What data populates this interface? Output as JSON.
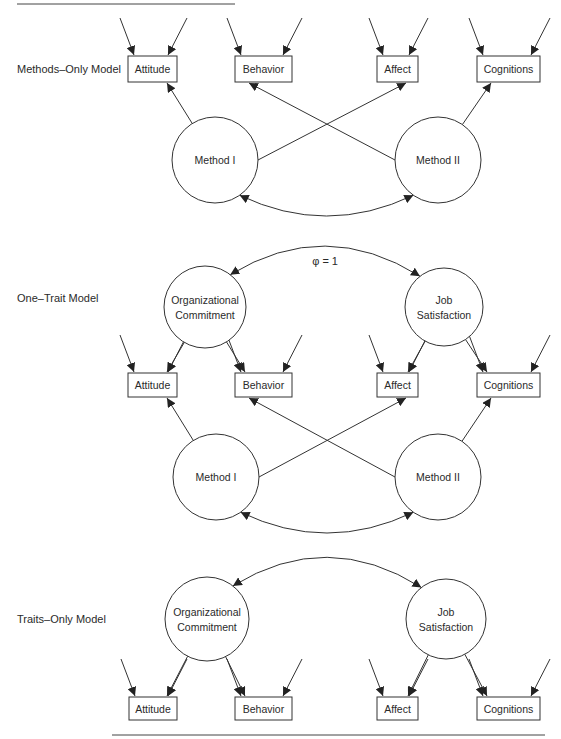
{
  "rules": {
    "top": {
      "x1": 17,
      "x2": 235,
      "y": 4
    },
    "bottom": {
      "x1": 112,
      "x2": 545,
      "y": 735
    }
  },
  "panels": [
    {
      "id": "methods-only",
      "label": "Methods–Only Model",
      "label_pos": [
        17,
        73
      ],
      "boxes": [
        {
          "id": "attitude",
          "label": "Attitude",
          "x": 128,
          "y": 56,
          "w": 49,
          "h": 26
        },
        {
          "id": "behavior",
          "label": "Behavior",
          "x": 235,
          "y": 56,
          "w": 57,
          "h": 26
        },
        {
          "id": "affect",
          "label": "Affect",
          "x": 377,
          "y": 56,
          "w": 41,
          "h": 26
        },
        {
          "id": "cognitions",
          "label": "Cognitions",
          "x": 477,
          "y": 56,
          "w": 63,
          "h": 26
        }
      ],
      "latents": [
        {
          "id": "method-1",
          "lines": [
            "Method I"
          ],
          "cx": 215,
          "cy": 160,
          "r": 43
        },
        {
          "id": "method-2",
          "lines": [
            "Method II"
          ],
          "cx": 438,
          "cy": 160,
          "r": 43
        }
      ],
      "loadings": [
        {
          "from": "method-1",
          "to": "attitude"
        },
        {
          "from": "method-1",
          "to": "affect"
        },
        {
          "from": "method-2",
          "to": "behavior"
        },
        {
          "from": "method-2",
          "to": "cognitions"
        }
      ],
      "correlation": {
        "a": "method-1",
        "b": "method-2",
        "sag": 26,
        "below": true,
        "label": ""
      },
      "errors_top": true
    },
    {
      "id": "one-trait",
      "label": "One–Trait Model",
      "label_pos": [
        17,
        302
      ],
      "boxes": [
        {
          "id": "attitude",
          "label": "Attitude",
          "x": 128,
          "y": 373,
          "w": 49,
          "h": 24
        },
        {
          "id": "behavior",
          "label": "Behavior",
          "x": 235,
          "y": 373,
          "w": 57,
          "h": 24
        },
        {
          "id": "affect",
          "label": "Affect",
          "x": 377,
          "y": 373,
          "w": 41,
          "h": 24
        },
        {
          "id": "cognitions",
          "label": "Cognitions",
          "x": 477,
          "y": 373,
          "w": 63,
          "h": 24
        }
      ],
      "latents": [
        {
          "id": "org-commitment",
          "lines": [
            "Organizational",
            "Commitment"
          ],
          "cx": 205,
          "cy": 307,
          "r": 41
        },
        {
          "id": "job-satisfaction",
          "lines": [
            "Job",
            "Satisfaction"
          ],
          "cx": 444,
          "cy": 307,
          "r": 39
        },
        {
          "id": "method-1",
          "lines": [
            "Method I"
          ],
          "cx": 216,
          "cy": 477,
          "r": 43
        },
        {
          "id": "method-2",
          "lines": [
            "Method II"
          ],
          "cx": 438,
          "cy": 477,
          "r": 43
        }
      ],
      "loadings": [
        {
          "from": "org-commitment",
          "to": "attitude",
          "down": true
        },
        {
          "from": "org-commitment",
          "to": "behavior",
          "down": true
        },
        {
          "from": "job-satisfaction",
          "to": "affect",
          "down": true
        },
        {
          "from": "job-satisfaction",
          "to": "cognitions",
          "down": true
        },
        {
          "from": "method-1",
          "to": "attitude"
        },
        {
          "from": "method-1",
          "to": "affect"
        },
        {
          "from": "method-2",
          "to": "behavior"
        },
        {
          "from": "method-2",
          "to": "cognitions"
        }
      ],
      "trait_correlation": {
        "a": "org-commitment",
        "b": "job-satisfaction",
        "label": "φ = 1"
      },
      "correlation": {
        "a": "method-1",
        "b": "method-2",
        "sag": 26,
        "below": true,
        "label": ""
      },
      "errors_top": true
    },
    {
      "id": "traits-only",
      "label": "Traits–Only Model",
      "label_pos": [
        17,
        623
      ],
      "boxes": [
        {
          "id": "attitude",
          "label": "Attitude",
          "x": 129,
          "y": 697,
          "w": 48,
          "h": 23
        },
        {
          "id": "behavior",
          "label": "Behavior",
          "x": 235,
          "y": 697,
          "w": 57,
          "h": 23
        },
        {
          "id": "affect",
          "label": "Affect",
          "x": 377,
          "y": 697,
          "w": 41,
          "h": 23
        },
        {
          "id": "cognitions",
          "label": "Cognitions",
          "x": 477,
          "y": 697,
          "w": 63,
          "h": 23
        }
      ],
      "latents": [
        {
          "id": "org-commitment",
          "lines": [
            "Organizational",
            "Commitment"
          ],
          "cx": 207,
          "cy": 619,
          "r": 42
        },
        {
          "id": "job-satisfaction",
          "lines": [
            "Job",
            "Satisfaction"
          ],
          "cx": 446,
          "cy": 619,
          "r": 40
        }
      ],
      "loadings": [
        {
          "from": "org-commitment",
          "to": "attitude",
          "down": true
        },
        {
          "from": "org-commitment",
          "to": "behavior",
          "down": true
        },
        {
          "from": "job-satisfaction",
          "to": "affect",
          "down": true
        },
        {
          "from": "job-satisfaction",
          "to": "cognitions",
          "down": true
        }
      ],
      "trait_correlation": {
        "a": "org-commitment",
        "b": "job-satisfaction",
        "label": ""
      },
      "errors_top": true
    }
  ]
}
